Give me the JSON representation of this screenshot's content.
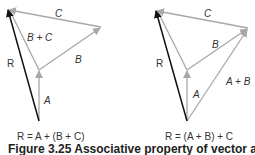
{
  "colors": {
    "vector_gray": "#a8a8a8",
    "resultant_black": "#111111",
    "label": "#333333"
  },
  "left_diagram": {
    "labels": {
      "A": "A",
      "B": "B",
      "C": "C",
      "BC": "B + C",
      "R": "R"
    },
    "equation": "R = A + (B + C)"
  },
  "right_diagram": {
    "labels": {
      "A": "A",
      "B": "B",
      "C": "C",
      "AB": "A + B",
      "R": "R"
    },
    "equation": "R = (A + B) + C"
  },
  "caption": "Figure 3.25 Associative property of vector addition"
}
